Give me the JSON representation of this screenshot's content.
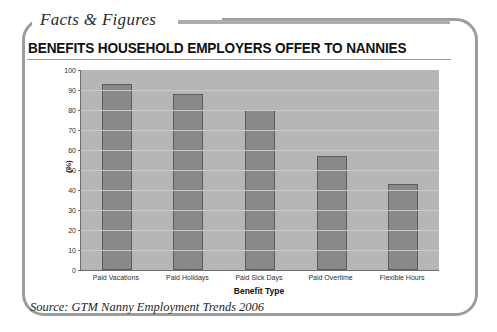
{
  "panel": {
    "kicker": "Facts & Figures",
    "headline": "BENEFITS HOUSEHOLD EMPLOYERS OFFER TO NANNIES",
    "source": "Source: GTM Nanny Employment Trends 2006"
  },
  "chart_data": {
    "type": "bar",
    "title": "BENEFITS HOUSEHOLD EMPLOYERS OFFER TO NANNIES",
    "categories": [
      "Paid Vacations",
      "Paid Holidays",
      "Paid Sick Days",
      "Paid Overtime",
      "Flexible Hours"
    ],
    "values": [
      93,
      88,
      80,
      57,
      43
    ],
    "xlabel": "Benefit Type",
    "ylabel": "(%)",
    "ylim": [
      0,
      100
    ],
    "yticks": [
      100,
      90,
      80,
      70,
      60,
      50,
      40,
      30,
      20,
      10,
      0
    ],
    "grid": true,
    "legend": "none",
    "colors": {
      "bar_fill": "#898989",
      "bar_border": "#5c5c5c",
      "plot_background": "#b6b6b6",
      "gridline": "#c9c9c9",
      "axis": "#6f6f6f",
      "frame": "#9d9d9d",
      "rule": "#adadad"
    }
  }
}
